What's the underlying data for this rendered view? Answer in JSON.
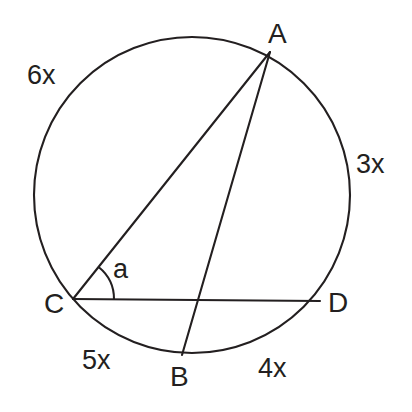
{
  "figure": {
    "background_color": "#ffffff",
    "stroke_color": "#231f20",
    "stroke_width": 2.1,
    "circle": {
      "cx": 192,
      "cy": 195,
      "r": 158
    },
    "points": [
      {
        "id": "A",
        "label": "A",
        "x": 270,
        "y": 52,
        "label_x": 268,
        "label_y": 20
      },
      {
        "id": "B",
        "label": "B",
        "x": 182,
        "y": 355,
        "label_x": 170,
        "label_y": 363
      },
      {
        "id": "C",
        "label": "C",
        "x": 73,
        "y": 299,
        "label_x": 44,
        "label_y": 290
      },
      {
        "id": "D",
        "label": "D",
        "x": 320,
        "y": 301,
        "label_x": 328,
        "label_y": 289
      }
    ],
    "segments": [
      {
        "id": "CA",
        "from": "C",
        "to": "A"
      },
      {
        "id": "AB",
        "from": "A",
        "to": "B"
      },
      {
        "id": "CD",
        "from": "C",
        "to": "D"
      }
    ],
    "angle_arc": {
      "vertex": "C",
      "label": "a",
      "radius": 41,
      "label_x": 113,
      "label_y": 256
    },
    "arc_labels": [
      {
        "id": "arc-AC",
        "text": "6x",
        "x": 27,
        "y": 62
      },
      {
        "id": "arc-AD",
        "text": "3x",
        "x": 356,
        "y": 151
      },
      {
        "id": "arc-CB",
        "text": "5x",
        "x": 82,
        "y": 347
      },
      {
        "id": "arc-BD",
        "text": "4x",
        "x": 258,
        "y": 355
      }
    ]
  }
}
